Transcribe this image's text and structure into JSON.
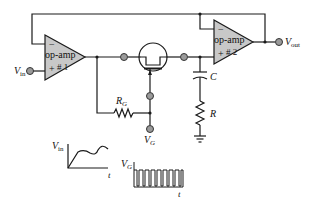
{
  "diagram": {
    "type": "circuit-schematic",
    "opamps": [
      {
        "id": "opamp1",
        "label_line1": "op-amp",
        "label_line2": "# 1",
        "minus": "−",
        "plus": "+"
      },
      {
        "id": "opamp2",
        "label_line1": "op-amp",
        "label_line2": "# 2",
        "minus": "−",
        "plus": "+"
      }
    ],
    "labels": {
      "vin_main": "V",
      "vin_sub": "in",
      "vout_main": "V",
      "vout_sub": "out",
      "rg_main": "R",
      "rg_sub": "G",
      "vg_main": "V",
      "vg_sub": "G",
      "c": "C",
      "r": "R"
    },
    "waveforms": [
      {
        "id": "vin-plot",
        "y_label_main": "V",
        "y_label_sub": "in",
        "x_label": "t",
        "shape": "rising-then-wavy"
      },
      {
        "id": "vg-plot",
        "y_label_main": "V",
        "y_label_sub": "G",
        "x_label": "t",
        "shape": "pulse-train",
        "pulse_count": 8
      }
    ],
    "colors": {
      "wire": "#1a1a1a",
      "opamp_fill": "#c8c8c8",
      "node_fill": "#9a9a9a"
    }
  }
}
